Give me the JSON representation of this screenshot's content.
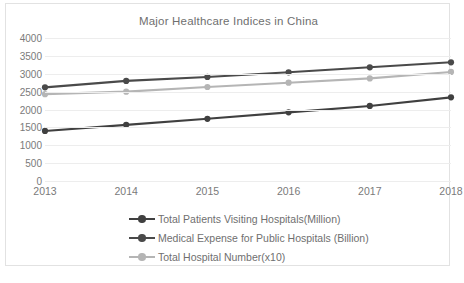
{
  "chart_data": {
    "type": "line",
    "title": "Major Healthcare Indices in China",
    "xlabel": "",
    "ylabel": "",
    "categories": [
      "2013",
      "2014",
      "2015",
      "2016",
      "2017",
      "2018"
    ],
    "x": [
      2013,
      2014,
      2015,
      2016,
      2017,
      2018
    ],
    "ylim": [
      0,
      4000
    ],
    "xlim": [
      2013,
      2018
    ],
    "y_ticks": [
      4000,
      3500,
      3000,
      2500,
      2000,
      1500,
      1000,
      500,
      0
    ],
    "grid": true,
    "legend_position": "bottom",
    "series": [
      {
        "name": "Total Patients Visiting Hospitals(Million)",
        "color": "#404040",
        "values": [
          1400,
          1570,
          1740,
          1920,
          2100,
          2340
        ]
      },
      {
        "name": "Medical Expense for Public Hospitals (Billion)",
        "color": "#4a4a4a",
        "values": [
          2620,
          2800,
          2910,
          3040,
          3180,
          3320
        ]
      },
      {
        "name": "Total Hospital Number(x10)",
        "color": "#b5b5b5",
        "values": [
          2430,
          2500,
          2630,
          2750,
          2870,
          3050
        ]
      }
    ]
  },
  "footer": {
    "note": ""
  }
}
